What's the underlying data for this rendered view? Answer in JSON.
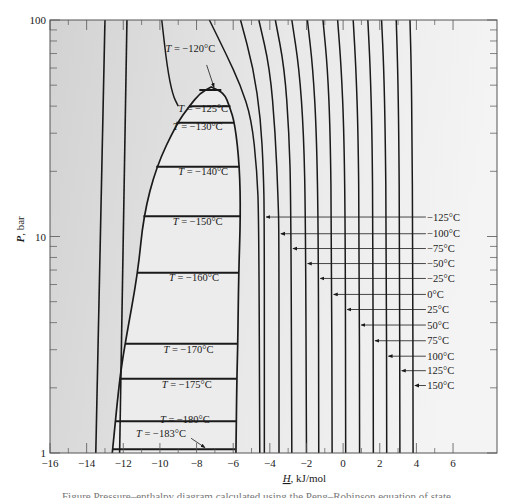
{
  "chart_data": {
    "type": "line",
    "xlabel": "H, kJ/mol",
    "xlabel_var": "H",
    "xlabel_unit": ", kJ/mol",
    "ylabel": "P, bar",
    "ylabel_var": "P",
    "ylabel_unit": ", bar",
    "x_scale": "linear",
    "y_scale": "log",
    "xlim": [
      -16,
      8.4
    ],
    "ylim": [
      1,
      100
    ],
    "x_ticks": [
      -16,
      -14,
      -12,
      -10,
      -8,
      -6,
      -4,
      -2,
      0,
      2,
      4,
      6
    ],
    "x_tick_labels": [
      "−16",
      "−14",
      "−12",
      "−10",
      "−8",
      "−6",
      "−4",
      "−2",
      "0",
      "2",
      "4",
      "6"
    ],
    "x_minor_ticks": [
      -15,
      -13,
      -11,
      -9,
      -7,
      -5,
      -3,
      -1,
      1,
      3,
      5
    ],
    "y_major_ticks": [
      1,
      10,
      100
    ],
    "y_tick_labels": [
      "1",
      "10",
      "100"
    ],
    "y_minor_ticks": [
      2,
      3,
      4,
      5,
      6,
      7,
      8,
      9,
      20,
      30,
      40,
      50,
      60,
      70,
      80,
      90
    ],
    "grid": false,
    "dome": {
      "label": "two-phase region",
      "saturated_liquid": [
        [
          -12.6,
          1
        ],
        [
          -12.2,
          2.2
        ],
        [
          -11.9,
          3.2
        ],
        [
          -11.2,
          6.8
        ],
        [
          -10.9,
          12.4
        ],
        [
          -10.2,
          21
        ],
        [
          -9.1,
          33
        ],
        [
          -8.4,
          40
        ],
        [
          -7.8,
          46
        ],
        [
          -7.2,
          49
        ]
      ],
      "saturated_vapor": [
        [
          -7.2,
          49
        ],
        [
          -6.5,
          46
        ],
        [
          -6.2,
          40
        ],
        [
          -5.9,
          33
        ],
        [
          -5.65,
          21
        ],
        [
          -5.6,
          12.4
        ],
        [
          -5.7,
          6.8
        ],
        [
          -5.75,
          3.2
        ],
        [
          -5.8,
          2.2
        ],
        [
          -5.85,
          1
        ]
      ]
    },
    "tie_lines": [
      {
        "T": "−120°C",
        "x1": -7.85,
        "x2": -6.65,
        "P": 47.5
      },
      {
        "T": "−125°C",
        "x1": -8.4,
        "x2": -6.15,
        "P": 40
      },
      {
        "T": "−130°C",
        "x1": -9.1,
        "x2": -5.95,
        "P": 33.5
      },
      {
        "T": "−140°C",
        "x1": -10.2,
        "x2": -5.65,
        "P": 21
      },
      {
        "T": "−150°C",
        "x1": -10.9,
        "x2": -5.6,
        "P": 12.4
      },
      {
        "T": "−160°C",
        "x1": -11.2,
        "x2": -5.7,
        "P": 6.8
      },
      {
        "T": "−170°C",
        "x1": -11.9,
        "x2": -5.75,
        "P": 3.2
      },
      {
        "T": "−175°C",
        "x1": -12.2,
        "x2": -5.8,
        "P": 2.2
      },
      {
        "T": "−180°C",
        "x1": -12.4,
        "x2": -5.85,
        "P": 1.4
      },
      {
        "T": "−183°C",
        "x1": -12.6,
        "x2": -5.9,
        "P": 1.04
      }
    ],
    "tie_line_labels": [
      {
        "text": "T = −120°C",
        "x": -9.7,
        "P": 71
      },
      {
        "text": "T = −125°C",
        "x": -9.0,
        "P": 37.4
      },
      {
        "text": "T = −130°C",
        "x": -9.3,
        "P": 31.0
      },
      {
        "text": "T = −140°C",
        "x": -9.0,
        "P": 19.3
      },
      {
        "text": "T = −150°C",
        "x": -9.3,
        "P": 11.3
      },
      {
        "text": "T = −160°C",
        "x": -9.5,
        "P": 6.2
      },
      {
        "text": "T = −170°C",
        "x": -9.8,
        "P": 2.9
      },
      {
        "text": "T = −175°C",
        "x": -9.9,
        "P": 2.0
      },
      {
        "text": "T = −180°C",
        "x": -10.0,
        "P": 1.37
      },
      {
        "text": "T = −183°C",
        "x": -11.3,
        "P": 1.19
      }
    ],
    "liquid_isotherms": [
      {
        "x_top": -13.0,
        "x_bottom": -13.5
      },
      {
        "x_top": -11.8,
        "x_bottom": -12.2
      }
    ],
    "supercritical_isotherms": [
      [
        [
          -9.9,
          100
        ],
        [
          -9.6,
          60
        ],
        [
          -9.3,
          45
        ],
        [
          -9.0,
          40
        ]
      ],
      [
        [
          -7.3,
          100
        ],
        [
          -6.4,
          70
        ],
        [
          -5.6,
          50
        ],
        [
          -5.0,
          35
        ],
        [
          -4.7,
          20
        ],
        [
          -4.6,
          12
        ],
        [
          -4.55,
          1
        ]
      ]
    ],
    "vapor_isotherms": [
      {
        "T": "−125°C",
        "pts": [
          [
            -5.6,
            100
          ],
          [
            -4.9,
            60
          ],
          [
            -4.5,
            35
          ],
          [
            -4.35,
            20
          ],
          [
            -4.3,
            12.3
          ],
          [
            -4.3,
            1
          ]
        ],
        "arrow_P": 12.3
      },
      {
        "T": "−100°C",
        "pts": [
          [
            -4.6,
            100
          ],
          [
            -4.0,
            60
          ],
          [
            -3.7,
            30
          ],
          [
            -3.55,
            15
          ],
          [
            -3.5,
            10.5
          ],
          [
            -3.5,
            1
          ]
        ],
        "arrow_P": 10.3
      },
      {
        "T": "−75°C",
        "pts": [
          [
            -3.7,
            100
          ],
          [
            -3.2,
            60
          ],
          [
            -2.95,
            30
          ],
          [
            -2.85,
            15
          ],
          [
            -2.8,
            1
          ]
        ],
        "arrow_P": 8.8
      },
      {
        "T": "−50°C",
        "pts": [
          [
            -2.8,
            100
          ],
          [
            -2.4,
            60
          ],
          [
            -2.15,
            30
          ],
          [
            -2.05,
            12
          ],
          [
            -2.0,
            1
          ]
        ],
        "arrow_P": 7.5
      },
      {
        "T": "−25°C",
        "pts": [
          [
            -1.95,
            100
          ],
          [
            -1.65,
            60
          ],
          [
            -1.45,
            30
          ],
          [
            -1.35,
            10
          ],
          [
            -1.33,
            1
          ]
        ],
        "arrow_P": 6.4
      },
      {
        "T": "0°C",
        "pts": [
          [
            -1.1,
            100
          ],
          [
            -0.85,
            60
          ],
          [
            -0.7,
            30
          ],
          [
            -0.63,
            10
          ],
          [
            -0.6,
            1
          ]
        ],
        "arrow_P": 5.4
      },
      {
        "T": "25°C",
        "pts": [
          [
            -0.3,
            100
          ],
          [
            -0.1,
            60
          ],
          [
            0.05,
            30
          ],
          [
            0.12,
            10
          ],
          [
            0.14,
            1
          ]
        ],
        "arrow_P": 4.6
      },
      {
        "T": "50°C",
        "pts": [
          [
            0.55,
            100
          ],
          [
            0.7,
            60
          ],
          [
            0.82,
            30
          ],
          [
            0.88,
            10
          ],
          [
            0.9,
            1
          ]
        ],
        "arrow_P": 3.9
      },
      {
        "T": "75°C",
        "pts": [
          [
            1.35,
            100
          ],
          [
            1.48,
            60
          ],
          [
            1.58,
            30
          ],
          [
            1.63,
            10
          ],
          [
            1.65,
            1
          ]
        ],
        "arrow_P": 3.3
      },
      {
        "T": "100°C",
        "pts": [
          [
            2.1,
            100
          ],
          [
            2.22,
            60
          ],
          [
            2.3,
            30
          ],
          [
            2.36,
            10
          ],
          [
            2.38,
            1
          ]
        ],
        "arrow_P": 2.8
      },
      {
        "T": "125°C",
        "pts": [
          [
            2.9,
            100
          ],
          [
            2.98,
            60
          ],
          [
            3.04,
            30
          ],
          [
            3.08,
            10
          ],
          [
            3.1,
            1
          ]
        ],
        "arrow_P": 2.4
      },
      {
        "T": "150°C",
        "pts": [
          [
            3.65,
            100
          ],
          [
            3.72,
            60
          ],
          [
            3.76,
            30
          ],
          [
            3.8,
            10
          ],
          [
            3.82,
            1
          ]
        ],
        "arrow_P": 2.05
      }
    ],
    "right_labels_x_start": 4.3,
    "right_labels_text_x": 4.7,
    "annotation_arrows": [
      {
        "from": [
          -7.45,
          62
        ],
        "to": [
          -7.05,
          49
        ],
        "label": "T = −120°C"
      },
      {
        "from": [
          -8.3,
          1.17
        ],
        "to": [
          -7.55,
          1.06
        ],
        "label": "T = −183°C"
      }
    ],
    "colors": {
      "line": "#1a1a1a",
      "background_left": "#d2d2d2",
      "background_right": "#f4f4f4",
      "dome_fill": "#ececec",
      "frame": "#555555"
    }
  },
  "caption": "Figure  Pressure–enthalpy diagram calculated using the Peng–Robinson equation of state"
}
